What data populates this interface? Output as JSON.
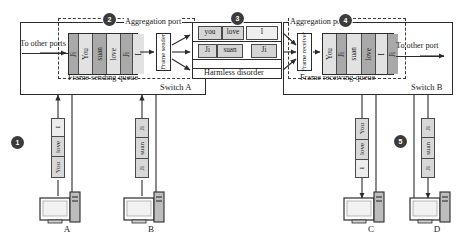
{
  "diagram": {
    "markers": [
      {
        "id": "1",
        "label": "1"
      },
      {
        "id": "2",
        "label": "2"
      },
      {
        "id": "3",
        "label": "3"
      },
      {
        "id": "4",
        "label": "4"
      },
      {
        "id": "5",
        "label": "5"
      }
    ]
  },
  "switch_a": {
    "name": "Switch A",
    "aggregation_port": "Aggregation port",
    "queue_caption": "Frame sending queue",
    "to_other_ports": "To other ports",
    "frame_sender": "Frame sender",
    "queue_cells": [
      "Ji",
      "You",
      "suan",
      "love",
      "Ji",
      "I"
    ]
  },
  "switch_b": {
    "name": "Switch B",
    "aggregation_port": "Aggregation port",
    "queue_caption": "Frame receiving queue",
    "to_other_port": "To other port",
    "frame_receiver": "Frame receiver",
    "queue_cells": [
      "You",
      "Ji",
      "suan",
      "love",
      "I",
      "Ji"
    ]
  },
  "harmless_disorder": {
    "caption": "Harmless disorder",
    "row_top": [
      "you",
      "love",
      "I"
    ],
    "row_bottom": [
      "Ji",
      "suan",
      "Ji"
    ]
  },
  "hosts": [
    {
      "name": "A",
      "frames": [
        "I",
        "love",
        "You"
      ]
    },
    {
      "name": "B",
      "frames": [
        "Ji",
        "suan",
        "Ji"
      ]
    },
    {
      "name": "C",
      "frames": [
        "You",
        "love",
        "I"
      ]
    },
    {
      "name": "D",
      "frames": [
        "Ji",
        "suan",
        "Ji"
      ]
    }
  ],
  "colors": {
    "stroke": "#2b2b2b",
    "cell_dark": "#a9a9a9",
    "cell_light": "#e2e2e2",
    "token": "#d5d5d5",
    "marker": "#3b3b3b"
  }
}
